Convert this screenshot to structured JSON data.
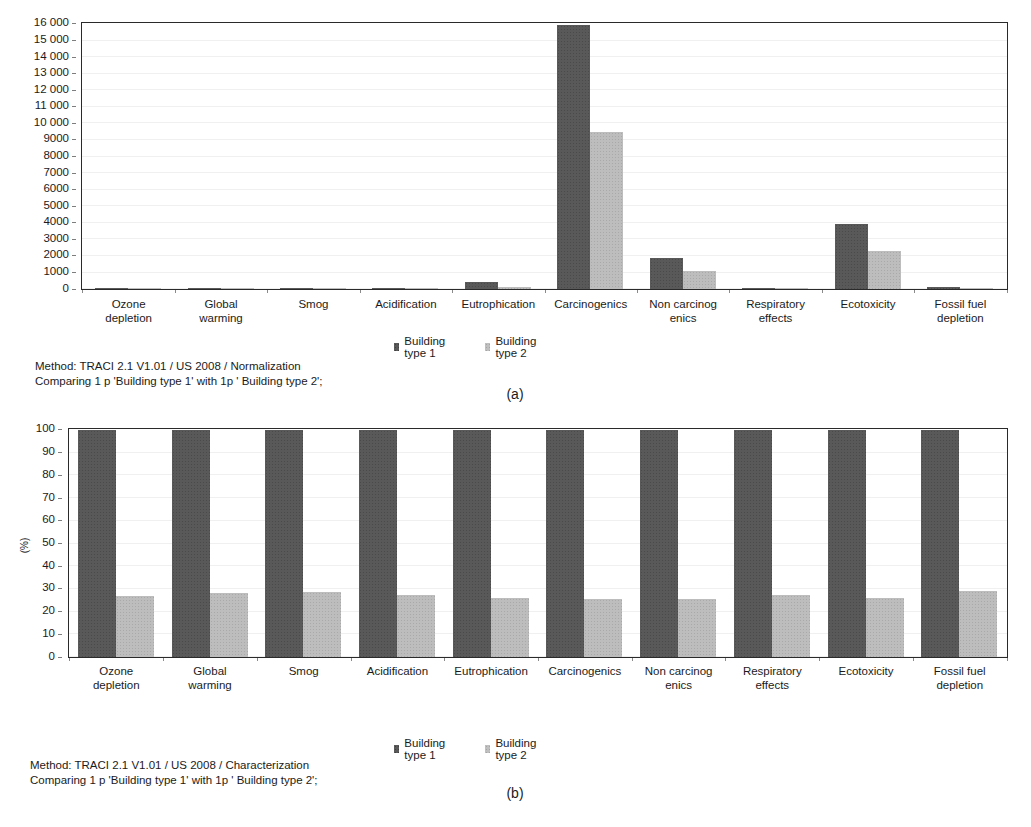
{
  "figure": {
    "panels": [
      {
        "letter": "(a)",
        "caption_line1": "Method: TRACI 2.1 V1.01 / US 2008 / Normalization",
        "caption_line2": "Comparing 1 p 'Building type 1' with 1p ' Building type 2';",
        "ylabel": "",
        "ytick_labels": [
          "16 000",
          "15 000",
          "14 000",
          "13 000",
          "12 000",
          "11 000",
          "10 000",
          "9000",
          "8000",
          "7000",
          "6000",
          "5000",
          "4000",
          "3000",
          "2000",
          "1000",
          "0"
        ]
      },
      {
        "letter": "(b)",
        "caption_line1": "Method: TRACI 2.1 V1.01 / US 2008 / Characterization",
        "caption_line2": "Comparing 1 p 'Building type 1' with 1p ' Building type 2';",
        "ylabel": "(%)",
        "ytick_labels": [
          "100",
          "90",
          "80",
          "70",
          "60",
          "50",
          "40",
          "30",
          "20",
          "10",
          "0"
        ]
      }
    ],
    "legend": {
      "series1_label": "Building type 1",
      "series2_label": "Building type 2",
      "series1_color": "#595959",
      "series2_color": "#bfbfbf"
    }
  },
  "chart_data": [
    {
      "type": "bar",
      "panel": "(a)",
      "title": "",
      "subtitle": "Method: TRACI 2.1 V1.01 / US 2008 / Normalization",
      "annotation": "Comparing 1 p 'Building type 1' with 1p ' Building type 2';",
      "xlabel": "",
      "ylabel": "",
      "ylim": [
        0,
        16000
      ],
      "ytick_step": 1000,
      "grid": true,
      "legend_position": "bottom-center",
      "categories": [
        "Ozone\ndepletion",
        "Global\nwarming",
        "Smog",
        "Acidification",
        "Eutrophication",
        "Carcinogenics",
        "Non carcinog\nenics",
        "Respiratory\neffects",
        "Ecotoxicity",
        "Fossil fuel\ndepletion"
      ],
      "series": [
        {
          "name": "Building type 1",
          "color": "#595959",
          "values": [
            30,
            80,
            55,
            70,
            420,
            15900,
            1900,
            60,
            3900,
            95
          ]
        },
        {
          "name": "Building type 2",
          "color": "#bfbfbf",
          "values": [
            8,
            22,
            15,
            20,
            150,
            9500,
            1100,
            16,
            2300,
            28
          ]
        }
      ]
    },
    {
      "type": "bar",
      "panel": "(b)",
      "title": "",
      "subtitle": "Method: TRACI 2.1 V1.01 / US 2008 / Characterization",
      "annotation": "Comparing 1 p 'Building type 1' with 1p ' Building type 2';",
      "xlabel": "",
      "ylabel": "(%)",
      "ylim": [
        0,
        100
      ],
      "ytick_step": 10,
      "grid": true,
      "legend_position": "bottom-center",
      "categories": [
        "Ozone\ndepletion",
        "Global\nwarming",
        "Smog",
        "Acidification",
        "Eutrophication",
        "Carcinogenics",
        "Non carcinog\nenics",
        "Respiratory\neffects",
        "Ecotoxicity",
        "Fossil fuel\ndepletion"
      ],
      "series": [
        {
          "name": "Building type 1",
          "color": "#595959",
          "values": [
            100,
            100,
            100,
            100,
            100,
            100,
            100,
            100,
            100,
            100
          ]
        },
        {
          "name": "Building type 2",
          "color": "#bfbfbf",
          "values": [
            27,
            28,
            28.5,
            27.5,
            26,
            25.5,
            25.5,
            27.5,
            26,
            29
          ]
        }
      ]
    }
  ]
}
